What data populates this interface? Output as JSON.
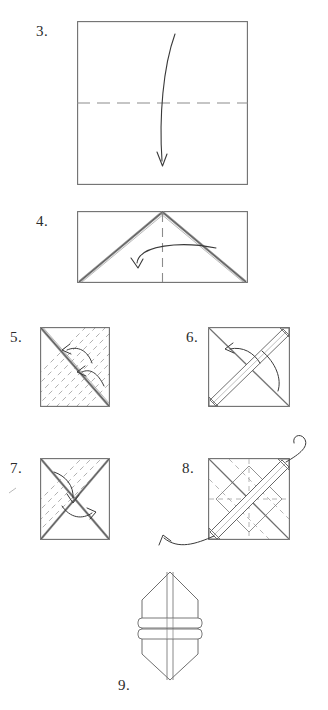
{
  "document": {
    "kind": "origami-instruction-diagram",
    "title": "Origami folding sequence, steps 3 through 9",
    "page_background": "#ffffff",
    "ink_color": "#3a3a3a",
    "crease_color": "#9a9a9a",
    "label_color": "#2b2b2b"
  },
  "steps": [
    {
      "number": "3.",
      "label_x": 36,
      "label_y": 24,
      "figure": {
        "name": "step3-square-horizontal-crease",
        "x": 77,
        "y": 21,
        "w": 171,
        "h": 164,
        "shape": "square",
        "creases": [
          {
            "type": "valley-dashed",
            "orientation": "horizontal",
            "position_ratio": 0.5
          }
        ],
        "arrows": [
          {
            "type": "curved-fold-arrow",
            "direction": "down",
            "from_ratio": [
              0.57,
              0.08
            ],
            "to_ratio": [
              0.58,
              0.88
            ]
          }
        ]
      }
    },
    {
      "number": "4.",
      "label_x": 36,
      "label_y": 214,
      "figure": {
        "name": "step4-rectangle-triangle-fold",
        "x": 77,
        "y": 211,
        "w": 171,
        "h": 72,
        "shape": "rectangle",
        "creases": [
          {
            "type": "valley-dashed",
            "orientation": "vertical",
            "position_ratio": 0.5
          },
          {
            "type": "folded-edge",
            "orientation": "diagonal-left",
            "note": "apex top-center to bottom-left"
          },
          {
            "type": "folded-edge",
            "orientation": "diagonal-right",
            "note": "apex top-center to bottom-right"
          }
        ],
        "arrows": [
          {
            "type": "curved-fold-arrow",
            "direction": "right-to-left",
            "from_ratio": [
              0.78,
              0.45
            ],
            "to_ratio": [
              0.4,
              0.72
            ]
          }
        ]
      }
    },
    {
      "number": "5.",
      "label_x": 10,
      "label_y": 330,
      "figure": {
        "name": "step5-square-hatched-diagonal",
        "x": 40,
        "y": 327,
        "w": 70,
        "h": 80,
        "shape": "square",
        "creases": [
          {
            "type": "folded-edge",
            "orientation": "diagonal-main",
            "note": "top-left to bottom-right double line"
          },
          {
            "type": "hatch-dashed",
            "orientation": "parallel-anti-diagonal",
            "count": 9
          }
        ],
        "arrows": [
          {
            "type": "curved-fold-arrow",
            "direction": "up-left",
            "from_ratio": [
              0.72,
              0.46
            ],
            "to_ratio": [
              0.36,
              0.3
            ]
          },
          {
            "type": "curved-fold-arrow",
            "direction": "left",
            "from_ratio": [
              0.88,
              0.72
            ],
            "to_ratio": [
              0.58,
              0.58
            ]
          }
        ]
      }
    },
    {
      "number": "6.",
      "label_x": 186,
      "label_y": 330,
      "figure": {
        "name": "step6-square-banded-diagonal",
        "x": 208,
        "y": 327,
        "w": 82,
        "h": 80,
        "shape": "square",
        "creases": [
          {
            "type": "folded-band",
            "orientation": "anti-diagonal",
            "note": "thick band bottom-left to top-right"
          },
          {
            "type": "folded-edge",
            "orientation": "diagonal-main"
          },
          {
            "type": "corner-tab",
            "position": "top-right"
          },
          {
            "type": "corner-tab",
            "position": "bottom-left"
          }
        ],
        "arrows": [
          {
            "type": "curved-fold-arrow",
            "direction": "up-left",
            "from_ratio": [
              0.62,
              0.44
            ],
            "to_ratio": [
              0.22,
              0.24
            ]
          },
          {
            "type": "curved-fold-arrow",
            "direction": "down-right",
            "from_ratio": [
              0.66,
              0.3
            ],
            "to_ratio": [
              0.92,
              0.74
            ]
          }
        ]
      }
    },
    {
      "number": "7.",
      "label_x": 10,
      "label_y": 461,
      "figure": {
        "name": "step7-square-x-creases-hatched",
        "x": 40,
        "y": 458,
        "w": 70,
        "h": 82,
        "shape": "square",
        "creases": [
          {
            "type": "folded-edge",
            "orientation": "diagonal-main"
          },
          {
            "type": "folded-edge",
            "orientation": "anti-diagonal"
          },
          {
            "type": "hatch-dashed",
            "orientation": "parallel-anti-diagonal",
            "count": 8,
            "region": "upper-left"
          }
        ],
        "arrows": [
          {
            "type": "curved-fold-arrow",
            "direction": "down-right",
            "from_ratio": [
              0.2,
              0.22
            ],
            "to_ratio": [
              0.46,
              0.5
            ]
          },
          {
            "type": "curved-fold-arrow",
            "direction": "right",
            "from_ratio": [
              0.36,
              0.6
            ],
            "to_ratio": [
              0.7,
              0.68
            ]
          }
        ]
      }
    },
    {
      "number": "8.",
      "label_x": 182,
      "label_y": 461,
      "figure": {
        "name": "step8-square-woven-bands",
        "x": 208,
        "y": 458,
        "w": 82,
        "h": 82,
        "shape": "square",
        "creases": [
          {
            "type": "folded-band",
            "orientation": "anti-diagonal",
            "note": "wide band bottom-left to top-right"
          },
          {
            "type": "folded-edge",
            "orientation": "diagonal-main"
          },
          {
            "type": "inner-square",
            "note": "rotated inner square of folded edges"
          },
          {
            "type": "hatch-dashed",
            "orientation": "parallel-diagonal",
            "count": 5
          },
          {
            "type": "corner-tab",
            "position": "top-right"
          },
          {
            "type": "corner-tab",
            "position": "bottom-left"
          }
        ],
        "arrows": [
          {
            "type": "curved-pull-arrow",
            "direction": "out-top-right",
            "note": "exits square at top-right corner"
          },
          {
            "type": "curved-pull-arrow",
            "direction": "out-bottom-left",
            "note": "exits square at bottom-left corner"
          }
        ]
      }
    },
    {
      "number": "9.",
      "label_x": 118,
      "label_y": 678,
      "figure": {
        "name": "step9-finished-model",
        "x": 135,
        "y": 570,
        "w": 70,
        "h": 112,
        "shape": "hexagonal-body",
        "creases": [
          {
            "type": "center-line",
            "orientation": "vertical"
          },
          {
            "type": "band",
            "orientation": "horizontal",
            "index": 1
          },
          {
            "type": "band",
            "orientation": "horizontal",
            "index": 2
          }
        ],
        "arrows": []
      }
    }
  ]
}
